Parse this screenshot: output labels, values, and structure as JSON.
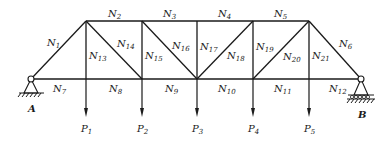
{
  "diagram": {
    "type": "truss",
    "nodes": {
      "A": {
        "x": 31,
        "y": 79
      },
      "B": {
        "x": 361,
        "y": 79
      },
      "T1": {
        "x": 86,
        "y": 21
      },
      "T2": {
        "x": 142,
        "y": 21
      },
      "T3": {
        "x": 197,
        "y": 21
      },
      "T4": {
        "x": 253,
        "y": 21
      },
      "T5": {
        "x": 309,
        "y": 21
      },
      "B1": {
        "x": 86,
        "y": 79
      },
      "B2": {
        "x": 142,
        "y": 79
      },
      "B3": {
        "x": 197,
        "y": 79
      },
      "B4": {
        "x": 253,
        "y": 79
      },
      "B5": {
        "x": 309,
        "y": 79
      }
    },
    "members": [
      {
        "id": "N1",
        "label": "N",
        "sub": "1",
        "from": "A",
        "to": "T1",
        "lx": 47,
        "ly": 46
      },
      {
        "id": "N2",
        "label": "N",
        "sub": "2",
        "from": "T1",
        "to": "T2",
        "lx": 108,
        "ly": 17
      },
      {
        "id": "N3",
        "label": "N",
        "sub": "3",
        "from": "T2",
        "to": "T3",
        "lx": 163,
        "ly": 17
      },
      {
        "id": "N4",
        "label": "N",
        "sub": "4",
        "from": "T3",
        "to": "T4",
        "lx": 218,
        "ly": 17
      },
      {
        "id": "N5",
        "label": "N",
        "sub": "5",
        "from": "T4",
        "to": "T5",
        "lx": 274,
        "ly": 17
      },
      {
        "id": "N6",
        "label": "N",
        "sub": "6",
        "from": "T5",
        "to": "B",
        "lx": 339,
        "ly": 47
      },
      {
        "id": "N7",
        "label": "N",
        "sub": "7",
        "from": "A",
        "to": "B1",
        "lx": 53,
        "ly": 92
      },
      {
        "id": "N8",
        "label": "N",
        "sub": "8",
        "from": "B1",
        "to": "B2",
        "lx": 109,
        "ly": 92
      },
      {
        "id": "N9",
        "label": "N",
        "sub": "9",
        "from": "B2",
        "to": "B3",
        "lx": 165,
        "ly": 92
      },
      {
        "id": "N10",
        "label": "N",
        "sub": "10",
        "from": "B3",
        "to": "B4",
        "lx": 218,
        "ly": 92
      },
      {
        "id": "N11",
        "label": "N",
        "sub": "11",
        "from": "B4",
        "to": "B5",
        "lx": 274,
        "ly": 92
      },
      {
        "id": "N12",
        "label": "N",
        "sub": "12",
        "from": "B5",
        "to": "B",
        "lx": 329,
        "ly": 92
      },
      {
        "id": "N13",
        "label": "N",
        "sub": "13",
        "from": "T1",
        "to": "B1",
        "lx": 89,
        "ly": 59
      },
      {
        "id": "N14",
        "label": "N",
        "sub": "14",
        "from": "T1",
        "to": "B2",
        "lx": 117,
        "ly": 47
      },
      {
        "id": "N15",
        "label": "N",
        "sub": "15",
        "from": "T2",
        "to": "B2",
        "lx": 145,
        "ly": 59
      },
      {
        "id": "N16",
        "label": "N",
        "sub": "16",
        "from": "T2",
        "to": "B3",
        "lx": 172,
        "ly": 49
      },
      {
        "id": "N17",
        "label": "N",
        "sub": "17",
        "from": "T3",
        "to": "B3",
        "lx": 200,
        "ly": 50
      },
      {
        "id": "N18",
        "label": "N",
        "sub": "18",
        "from": "B3",
        "to": "T4",
        "lx": 227,
        "ly": 59
      },
      {
        "id": "N19",
        "label": "N",
        "sub": "19",
        "from": "T4",
        "to": "B4",
        "lx": 256,
        "ly": 50
      },
      {
        "id": "N20",
        "label": "N",
        "sub": "20",
        "from": "B4",
        "to": "T5",
        "lx": 283,
        "ly": 60
      },
      {
        "id": "N21",
        "label": "N",
        "sub": "21",
        "from": "T5",
        "to": "B5",
        "lx": 312,
        "ly": 59
      }
    ],
    "loads": [
      {
        "id": "P1",
        "label": "P",
        "sub": "1",
        "node": "B1",
        "x": 86
      },
      {
        "id": "P2",
        "label": "P",
        "sub": "2",
        "node": "B2",
        "x": 142
      },
      {
        "id": "P3",
        "label": "P",
        "sub": "3",
        "node": "B3",
        "x": 197
      },
      {
        "id": "P4",
        "label": "P",
        "sub": "4",
        "node": "B4",
        "x": 253
      },
      {
        "id": "P5",
        "label": "P",
        "sub": "5",
        "node": "B5",
        "x": 309
      }
    ],
    "supports": [
      {
        "id": "A",
        "label": "A",
        "type": "pin",
        "node": "A"
      },
      {
        "id": "B",
        "label": "B",
        "type": "roller",
        "node": "B"
      }
    ]
  }
}
